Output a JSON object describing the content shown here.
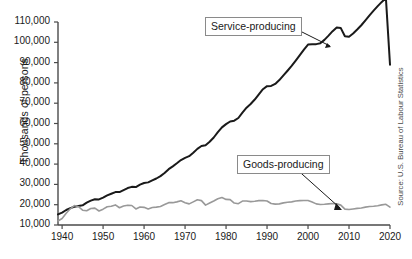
{
  "chart_data": {
    "type": "line",
    "title": "",
    "xlabel": "",
    "ylabel": "Thousands of persons",
    "xlim": [
      1939,
      2020
    ],
    "ylim": [
      10000,
      110000
    ],
    "xticks": [
      1940,
      1950,
      1960,
      1970,
      1980,
      1990,
      2000,
      2010,
      2020
    ],
    "xtick_labels": [
      "1940",
      "1950",
      "1960",
      "1970",
      "1980",
      "1990",
      "2000",
      "2010",
      "2020"
    ],
    "yticks": [
      10000,
      20000,
      30000,
      40000,
      50000,
      60000,
      70000,
      80000,
      90000,
      100000,
      110000
    ],
    "ytick_labels": [
      "10,000",
      "20,000",
      "30,000",
      "40,000",
      "50,000",
      "60,000",
      "70,000",
      "80,000",
      "90,000",
      "100,000",
      "110,000"
    ],
    "grid": false,
    "legend_position": "annotations",
    "source": "Source: U.S. Bureau of Labour Statistics",
    "annotations": [
      {
        "label": "Service-producing",
        "series": "Service-producing"
      },
      {
        "label": "Goods-producing",
        "series": "Goods-producing"
      }
    ],
    "x": [
      1939,
      1940,
      1941,
      1942,
      1943,
      1944,
      1945,
      1946,
      1947,
      1948,
      1949,
      1950,
      1951,
      1952,
      1953,
      1954,
      1955,
      1956,
      1957,
      1958,
      1959,
      1960,
      1961,
      1962,
      1963,
      1964,
      1965,
      1966,
      1967,
      1968,
      1969,
      1970,
      1971,
      1972,
      1973,
      1974,
      1975,
      1976,
      1977,
      1978,
      1979,
      1980,
      1981,
      1982,
      1983,
      1984,
      1985,
      1986,
      1987,
      1988,
      1989,
      1990,
      1991,
      1992,
      1993,
      1994,
      1995,
      1996,
      1997,
      1998,
      1999,
      2000,
      2001,
      2002,
      2003,
      2004,
      2005,
      2006,
      2007,
      2008,
      2009,
      2010,
      2011,
      2012,
      2013,
      2014,
      2015,
      2016,
      2017,
      2018,
      2019,
      2020
    ],
    "series": [
      {
        "name": "Service-producing",
        "color": "#1a1a1a",
        "values": [
          15200,
          16100,
          17400,
          18300,
          19000,
          19400,
          19700,
          21000,
          22000,
          22700,
          22600,
          23500,
          24600,
          25400,
          26200,
          26200,
          27200,
          28200,
          28800,
          28700,
          29900,
          30700,
          31000,
          32000,
          32900,
          34100,
          35600,
          37500,
          38900,
          40400,
          42000,
          43100,
          43900,
          45600,
          47500,
          48900,
          49300,
          51000,
          53100,
          55700,
          58100,
          59700,
          61000,
          61400,
          62700,
          65400,
          67800,
          69600,
          71800,
          74400,
          76900,
          78400,
          78500,
          79500,
          81400,
          83700,
          86000,
          88400,
          91000,
          93700,
          96400,
          98900,
          99100,
          99100,
          99500,
          101200,
          103300,
          105500,
          107300,
          107000,
          103000,
          102700,
          104300,
          106300,
          108400,
          110800,
          113300,
          115600,
          117800,
          119900,
          121800,
          89000
        ]
      },
      {
        "name": "Goods-producing",
        "color": "#999999",
        "values": [
          12000,
          13200,
          15800,
          18000,
          19600,
          19000,
          17300,
          17000,
          18100,
          18300,
          16900,
          17800,
          19000,
          19200,
          19900,
          18500,
          19400,
          19700,
          19600,
          17900,
          18900,
          18700,
          17900,
          18600,
          18800,
          19100,
          20100,
          21000,
          21000,
          21400,
          21900,
          21000,
          20400,
          21400,
          22400,
          22000,
          19800,
          20800,
          21800,
          22900,
          23500,
          22600,
          22500,
          20800,
          20500,
          21800,
          21800,
          21500,
          21700,
          22000,
          22100,
          21800,
          20600,
          20300,
          20400,
          20900,
          21200,
          21400,
          21800,
          22000,
          22100,
          22100,
          21300,
          20400,
          20100,
          20200,
          20400,
          20600,
          20400,
          19800,
          17800,
          17600,
          17900,
          18200,
          18400,
          18800,
          19100,
          19200,
          19500,
          19900,
          20200,
          18800
        ]
      }
    ]
  },
  "axis": {
    "ylabel": "Thousands of persons"
  },
  "source": {
    "text": "Source: U.S. Bureau of Labour Statistics"
  },
  "annotations": {
    "service": "Service-producing",
    "goods": "Goods-producing"
  }
}
